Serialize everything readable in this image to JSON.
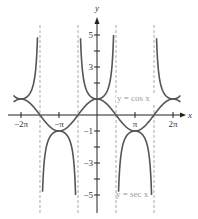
{
  "chart_data": {
    "type": "line",
    "title": "",
    "xlabel": "x",
    "ylabel": "y",
    "xlim": [
      -6.9,
      7.2
    ],
    "ylim": [
      -6.2,
      6.0
    ],
    "x_ticks": [
      {
        "value": -6.2832,
        "label": "−2π"
      },
      {
        "value": -3.1416,
        "label": "−π"
      },
      {
        "value": 3.1416,
        "label": "π"
      },
      {
        "value": 6.2832,
        "label": "2π"
      }
    ],
    "y_ticks": [
      {
        "value": 5,
        "label": "5"
      },
      {
        "value": 4,
        "label": ""
      },
      {
        "value": 3,
        "label": "3"
      },
      {
        "value": 2,
        "label": ""
      },
      {
        "value": 1,
        "label": ""
      },
      {
        "value": -1,
        "label": "−1"
      },
      {
        "value": -2,
        "label": ""
      },
      {
        "value": -3,
        "label": "−3"
      },
      {
        "value": -4,
        "label": ""
      },
      {
        "value": -5,
        "label": "−5"
      }
    ],
    "series": [
      {
        "name": "y = cos x",
        "function": "cos(x)",
        "domain": [
          -6.9,
          6.9
        ]
      },
      {
        "name": "y = sec x",
        "function": "1/cos(x)",
        "domain": [
          -6.9,
          6.9
        ],
        "clip": [
          -5,
          5
        ]
      }
    ],
    "asymptotes": [
      -4.7124,
      -1.5708,
      1.5708,
      4.7124
    ],
    "annotations": [
      {
        "text": "y = cos x",
        "x": 1.6,
        "y": 1
      },
      {
        "text": "y = sec x",
        "x": 1.6,
        "y": -5
      }
    ],
    "grid": false,
    "legend": "none"
  },
  "axis_labels": {
    "x": "x",
    "y": "y"
  },
  "styles": {
    "curve_color": "#555555",
    "asymptote_color": "#aaaaaa",
    "label_color": "#999999"
  }
}
